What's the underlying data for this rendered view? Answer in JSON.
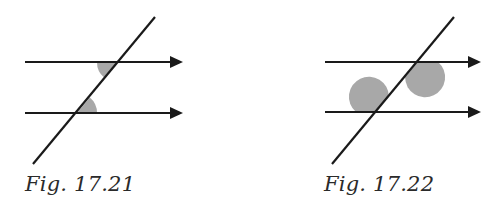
{
  "figures": [
    {
      "id": "fig-17-21",
      "caption": "Fig. 17.21",
      "description": "Two parallel arrowed lines cut by a transversal; alternate interior angles shaded",
      "shaded_angle_type": "alternate-interior"
    },
    {
      "id": "fig-17-22",
      "caption": "Fig. 17.22",
      "description": "Two parallel arrowed lines cut by a transversal; alternate interior (obtuse) angles shaded",
      "shaded_angle_type": "alternate-interior-obtuse"
    }
  ],
  "colors": {
    "line": "#1a1a1a",
    "shade": "#a8a8a8",
    "caption": "#2a2a2a",
    "background": "#ffffff"
  }
}
